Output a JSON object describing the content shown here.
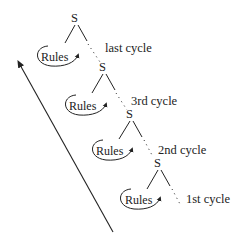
{
  "diagram": {
    "node_symbol": "S",
    "rules_label": "Rules",
    "cycles": [
      {
        "label": "last cycle"
      },
      {
        "label": "3rd cycle"
      },
      {
        "label": "2nd cycle"
      },
      {
        "label": "1st cycle"
      }
    ],
    "arrow": {
      "direction": "bottom-right to top-left",
      "meaning": "derivation order"
    },
    "stroke_color": "#222222",
    "background": "#ffffff"
  }
}
